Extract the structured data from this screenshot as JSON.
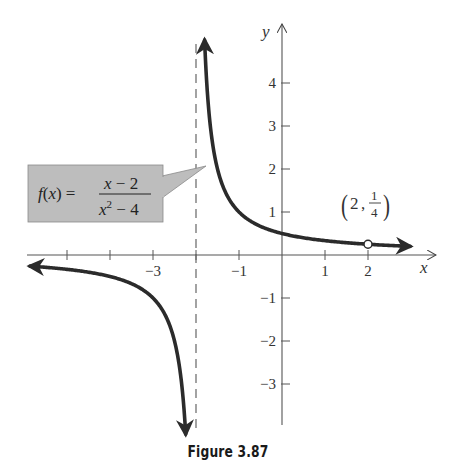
{
  "chart_data": {
    "type": "line",
    "title": "",
    "function_label": "f(x) = (x − 2)/(x² − 4)",
    "function_parts": {
      "lhs": "f(x) =",
      "numerator": "x − 2",
      "denominator_base": "x",
      "denominator_exp": "2",
      "denominator_rest": " − 4"
    },
    "xlabel": "x",
    "ylabel": "y",
    "xlim": [
      -6,
      3.5
    ],
    "ylim": [
      -4.2,
      5.2
    ],
    "x_ticks": [
      -5,
      -4,
      -3,
      -2,
      -1,
      1,
      2
    ],
    "x_tick_labels": [
      {
        "value": -3,
        "text": "−3"
      },
      {
        "value": -1,
        "text": "−1"
      },
      {
        "value": 1,
        "text": "1"
      },
      {
        "value": 2,
        "text": "2"
      }
    ],
    "y_ticks": [
      4,
      3,
      2,
      1,
      -1,
      -2,
      -3
    ],
    "y_tick_labels": [
      {
        "value": 4,
        "text": "4"
      },
      {
        "value": 3,
        "text": "3"
      },
      {
        "value": 2,
        "text": "2"
      },
      {
        "value": 1,
        "text": "1"
      },
      {
        "value": -1,
        "text": "−1"
      },
      {
        "value": -2,
        "text": "−2"
      },
      {
        "value": -3,
        "text": "−3"
      }
    ],
    "vertical_asymptote": -2,
    "horizontal_asymptote": 0,
    "hole": {
      "x": 2,
      "y": 0.25,
      "label_x": "2",
      "label_num": "1",
      "label_den": "4"
    },
    "series": [
      {
        "name": "right branch",
        "x": [
          -1.8,
          -1.7,
          -1.5,
          -1,
          -0.5,
          0,
          0.5,
          1,
          1.5,
          2,
          2.5,
          2.98
        ],
        "y": [
          5.0,
          3.33,
          2.0,
          1.0,
          0.667,
          0.5,
          0.4,
          0.333,
          0.286,
          0.25,
          0.222,
          0.201
        ]
      },
      {
        "name": "left branch",
        "x": [
          -5.86,
          -5,
          -4,
          -3,
          -2.5,
          -2.3,
          -2.24
        ],
        "y": [
          -0.259,
          -0.333,
          -0.5,
          -1.0,
          -2.0,
          -3.33,
          -4.17
        ]
      }
    ],
    "grid": false,
    "legend": null
  },
  "caption": "Figure 3.87",
  "colors": {
    "curve": "#2b2b2b",
    "axis": "#555555",
    "callout_fill": "#bdbdbd",
    "callout_border": "#8a8a8a"
  }
}
